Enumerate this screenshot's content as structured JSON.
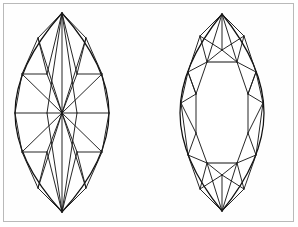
{
  "figure": {
    "background_color": "#ffffff",
    "border_color": "#b9b9b9",
    "line_color": "#111111",
    "width": 298,
    "height": 227,
    "caption": ""
  },
  "diagrams": [
    {
      "name": "marquise-star-facet-view",
      "label": "",
      "shape": "marquise",
      "center_x": 62,
      "center_y": 113,
      "top_tip": {
        "x": 62,
        "y": 13
      },
      "bottom_tip": {
        "x": 62,
        "y": 212
      },
      "left_edge_x": 15,
      "right_edge_x": 109,
      "half_width": 47,
      "half_height": 100,
      "pattern": "star-burst pavilion with central culet point",
      "facet_count": 32,
      "outline": "M 62 13 C 91 46 109 80 109 113 C 109 146 91 180 62 212 C 33 180 15 146 15 113 C 15 80 33 46 62 13 Z",
      "facets": [
        "M 62 13 L 62 113",
        "M 62 13 L 47 113",
        "M 62 13 L 77 113",
        "M 62 13 L 38 38",
        "M 62 13 L 86 38",
        "M 38 38 L 62 113",
        "M 86 38 L 62 113",
        "M 38 38 L 22 74",
        "M 86 38 L 102 74",
        "M 22 74 L 62 113",
        "M 102 74 L 62 113",
        "M 22 74 L 15 113",
        "M 102 74 L 109 113",
        "M 15 113 L 62 113",
        "M 109 113 L 62 113",
        "M 62 212 L 62 113",
        "M 62 212 L 47 113",
        "M 62 212 L 77 113",
        "M 62 212 L 38 188",
        "M 62 212 L 86 188",
        "M 38 188 L 62 113",
        "M 86 188 L 62 113",
        "M 38 188 L 22 152",
        "M 86 188 L 102 152",
        "M 22 152 L 62 113",
        "M 102 152 L 62 113",
        "M 22 152 L 15 113",
        "M 102 152 L 109 113",
        "M 38 38 L 47 74",
        "M 86 38 L 77 74",
        "M 38 188 L 47 152",
        "M 86 188 L 77 152",
        "M 47 74 L 22 74",
        "M 77 74 L 102 74",
        "M 47 152 L 22 152",
        "M 77 152 L 102 152",
        "M 47 74 L 62 113",
        "M 77 74 L 62 113",
        "M 47 152 L 62 113",
        "M 77 152 L 62 113",
        "M 47 74 L 62 13",
        "M 77 74 L 62 13",
        "M 47 152 L 62 212",
        "M 77 152 L 62 212"
      ]
    },
    {
      "name": "marquise-table-facet-view",
      "label": "",
      "shape": "marquise",
      "center_x": 222,
      "center_y": 113,
      "top_tip": {
        "x": 222,
        "y": 14
      },
      "bottom_tip": {
        "x": 222,
        "y": 211
      },
      "left_edge_x": 180,
      "right_edge_x": 264,
      "half_width": 42,
      "half_height": 99,
      "pattern": "brilliant crown with rectangular table and kite facets",
      "facet_count": 40,
      "table": {
        "top_y": 62,
        "bottom_y": 163,
        "left_x": 207,
        "right_x": 237,
        "top_edge": "M 207 62 L 237 62",
        "bottom_edge": "M 207 163 L 237 163"
      },
      "outline": "M 222 14 C 248 46 264 80 264 113 C 264 146 248 179 222 211 C 196 179 180 146 180 113 C 180 80 196 46 222 14 Z",
      "facets": [
        "M 222 14 L 207 62",
        "M 222 14 L 237 62",
        "M 222 14 L 200 36",
        "M 222 14 L 244 36",
        "M 200 36 L 207 62",
        "M 244 36 L 237 62",
        "M 200 36 L 222 50",
        "M 244 36 L 222 50",
        "M 222 50 L 207 62",
        "M 222 50 L 237 62",
        "M 222 14 L 222 50",
        "M 200 36 L 188 72",
        "M 244 36 L 256 72",
        "M 188 72 L 207 62",
        "M 256 72 L 237 62",
        "M 188 72 L 196 94",
        "M 256 72 L 248 94",
        "M 196 94 L 207 62",
        "M 248 94 L 237 62",
        "M 188 72 L 181 103",
        "M 256 72 L 263 103",
        "M 196 94 L 181 103",
        "M 248 94 L 263 103",
        "M 181 103 L 196 133",
        "M 263 103 L 248 133",
        "M 196 94 L 196 133",
        "M 248 94 L 248 133",
        "M 181 103 L 188 155",
        "M 263 103 L 256 155",
        "M 196 133 L 188 155",
        "M 248 133 L 256 155",
        "M 196 133 L 207 163",
        "M 248 133 L 237 163",
        "M 188 155 L 207 163",
        "M 256 155 L 237 163",
        "M 222 211 L 207 163",
        "M 222 211 L 237 163",
        "M 222 211 L 200 189",
        "M 222 211 L 244 189",
        "M 200 189 L 207 163",
        "M 244 189 L 237 163",
        "M 200 189 L 222 175",
        "M 244 189 L 222 175",
        "M 222 175 L 207 163",
        "M 222 175 L 237 163",
        "M 222 211 L 222 175",
        "M 188 155 L 200 189",
        "M 256 155 L 244 189",
        "M 196 94 L 188 72",
        "M 248 94 L 256 72"
      ]
    }
  ]
}
